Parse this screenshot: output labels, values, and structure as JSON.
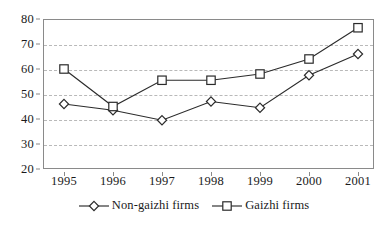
{
  "chart_data": {
    "type": "line",
    "title": "",
    "xlabel": "",
    "ylabel": "",
    "categories": [
      "1995",
      "1996",
      "1997",
      "1998",
      "1999",
      "2000",
      "2001"
    ],
    "x": [
      1995,
      1996,
      1997,
      1998,
      1999,
      2000,
      2001
    ],
    "ylim": [
      20,
      80
    ],
    "yticks": [
      20,
      30,
      40,
      50,
      60,
      70,
      80
    ],
    "ytick_labels": [
      "20",
      "30",
      "40",
      "50",
      "60",
      "70",
      "80"
    ],
    "grid": "horizontal-dashed",
    "legend_position": "bottom-center",
    "series": [
      {
        "name": "Non-gaizhi firms",
        "marker": "diamond-open",
        "color": "#2b2b2b",
        "values": [
          46,
          43.5,
          39.5,
          47,
          44.5,
          57.5,
          66
        ]
      },
      {
        "name": "Gaizhi firms",
        "marker": "square-open",
        "color": "#2b2b2b",
        "values": [
          60,
          45,
          55.5,
          55.5,
          58,
          64,
          76.5
        ]
      }
    ]
  },
  "legend": {
    "items": [
      {
        "label": "Non-gaizhi firms",
        "marker": "diamond-open"
      },
      {
        "label": "Gaizhi firms",
        "marker": "square-open"
      }
    ]
  },
  "colors": {
    "axis": "#8a8a8a",
    "grid": "#b9b9b9",
    "line": "#2b2b2b",
    "text": "#1a1a1a",
    "background": "#ffffff"
  }
}
